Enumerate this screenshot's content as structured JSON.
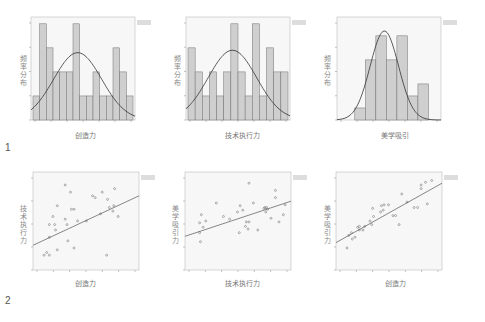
{
  "panel_labels": [
    "1",
    "2"
  ],
  "chart_data": [
    {
      "type": "bar",
      "title": "",
      "subtype": "histogram_with_normal_curve",
      "xlabel": "创造力",
      "ylabel": "频率分布",
      "categories": [
        "b1",
        "b2",
        "b3",
        "b4",
        "b5",
        "b6",
        "b7",
        "b8",
        "b9",
        "b10",
        "b11",
        "b12",
        "b13",
        "b14",
        "b15"
      ],
      "values": [
        1,
        4,
        3,
        2,
        2,
        2,
        4,
        1,
        1,
        2,
        1,
        1,
        3,
        2,
        1
      ],
      "ylim": [
        0,
        4.2
      ],
      "normal_curve": {
        "peak_bin": 7.5,
        "peak": 2.8,
        "sd_bins": 3.6
      },
      "legend": "Mean / Std. Dev. / N",
      "grid": false
    },
    {
      "type": "bar",
      "title": "",
      "subtype": "histogram_with_normal_curve",
      "xlabel": "技术执行力",
      "ylabel": "频率分布",
      "categories": [
        "b1",
        "b2",
        "b3",
        "b4",
        "b5",
        "b6",
        "b7",
        "b8",
        "b9",
        "b10",
        "b11",
        "b12",
        "b13",
        "b14"
      ],
      "values": [
        3,
        2,
        1,
        2,
        1,
        2,
        4,
        2,
        1,
        4,
        1,
        3,
        2,
        2
      ],
      "ylim": [
        0,
        4.2
      ],
      "normal_curve": {
        "peak_bin": 7.0,
        "peak": 2.9,
        "sd_bins": 3.4
      },
      "legend": "Mean / Std. Dev. / N",
      "grid": false
    },
    {
      "type": "bar",
      "title": "",
      "subtype": "histogram_with_normal_curve",
      "xlabel": "美学吸引",
      "ylabel": "频率分布",
      "categories": [
        "b1",
        "b2",
        "b3",
        "b4",
        "b5",
        "b6",
        "b7"
      ],
      "values": [
        1,
        5,
        7,
        5,
        7,
        2,
        3
      ],
      "ylim": [
        0,
        8.4
      ],
      "normal_curve": {
        "peak_bin": 3.5,
        "peak": 7.4,
        "sd_bins": 1.35
      },
      "bar_offset_bins": 1.5,
      "total_bins": 9.5,
      "legend": "Mean / Std. Dev. / N",
      "grid": false
    },
    {
      "type": "scatter",
      "title": "",
      "xlabel": "创造力",
      "ylabel": "技术执行力",
      "legend": "R² Linear = 0.176",
      "xlim": [
        0,
        100
      ],
      "ylim": [
        0,
        100
      ],
      "points": [
        [
          8,
          12
        ],
        [
          11,
          15
        ],
        [
          14,
          12
        ],
        [
          14,
          32
        ],
        [
          14,
          46
        ],
        [
          18,
          55
        ],
        [
          20,
          46
        ],
        [
          21,
          40
        ],
        [
          23,
          18
        ],
        [
          23,
          67
        ],
        [
          32,
          90
        ],
        [
          32,
          52
        ],
        [
          34,
          46
        ],
        [
          35,
          28
        ],
        [
          38,
          82
        ],
        [
          39,
          63
        ],
        [
          42,
          63
        ],
        [
          42,
          20
        ],
        [
          46,
          50
        ],
        [
          56,
          50
        ],
        [
          63,
          78
        ],
        [
          66,
          76
        ],
        [
          72,
          58
        ],
        [
          74,
          82
        ],
        [
          79,
          12
        ],
        [
          80,
          74
        ],
        [
          82,
          65
        ],
        [
          86,
          61
        ],
        [
          88,
          86
        ],
        [
          87,
          67
        ],
        [
          92,
          55
        ]
      ],
      "trend": {
        "x": [
          0,
          100
        ],
        "y": [
          23,
          78
        ]
      }
    },
    {
      "type": "scatter",
      "title": "",
      "xlabel": "技术执行力",
      "ylabel": "美学吸引力",
      "legend": "R² Linear",
      "xlim": [
        0,
        100
      ],
      "ylim": [
        0,
        100
      ],
      "points": [
        [
          12,
          48
        ],
        [
          12,
          37
        ],
        [
          13,
          27
        ],
        [
          14,
          57
        ],
        [
          16,
          43
        ],
        [
          19,
          50
        ],
        [
          31,
          70
        ],
        [
          39,
          55
        ],
        [
          46,
          52
        ],
        [
          55,
          60
        ],
        [
          57,
          37
        ],
        [
          58,
          67
        ],
        [
          61,
          62
        ],
        [
          64,
          44
        ],
        [
          65,
          49
        ],
        [
          67,
          41
        ],
        [
          68,
          49
        ],
        [
          68,
          92
        ],
        [
          73,
          70
        ],
        [
          78,
          40
        ],
        [
          85,
          64
        ],
        [
          86,
          65
        ],
        [
          87,
          60
        ],
        [
          88,
          65
        ],
        [
          89,
          63
        ],
        [
          93,
          53
        ],
        [
          98,
          76
        ],
        [
          98,
          84
        ],
        [
          102,
          49
        ],
        [
          109,
          68
        ],
        [
          107,
          57
        ]
      ],
      "trend": {
        "x": [
          0,
          100
        ],
        "y": [
          33,
          72
        ]
      }
    },
    {
      "type": "scatter",
      "title": "",
      "xlabel": "创造力",
      "ylabel": "美学吸引力",
      "legend": "R² Linear = 0.778",
      "xlim": [
        0,
        100
      ],
      "ylim": [
        0,
        100
      ],
      "points": [
        [
          8,
          20
        ],
        [
          10,
          34
        ],
        [
          13,
          37
        ],
        [
          14,
          30
        ],
        [
          17,
          32
        ],
        [
          20,
          43
        ],
        [
          22,
          40
        ],
        [
          22,
          44
        ],
        [
          26,
          40
        ],
        [
          28,
          44
        ],
        [
          34,
          50
        ],
        [
          36,
          46
        ],
        [
          37,
          64
        ],
        [
          38,
          55
        ],
        [
          46,
          60
        ],
        [
          47,
          67
        ],
        [
          49,
          62
        ],
        [
          50,
          68
        ],
        [
          55,
          68
        ],
        [
          60,
          56
        ],
        [
          63,
          56
        ],
        [
          67,
          46
        ],
        [
          70,
          80
        ],
        [
          76,
          71
        ],
        [
          84,
          65
        ],
        [
          88,
          65
        ],
        [
          92,
          86
        ],
        [
          92,
          90
        ],
        [
          97,
          93
        ],
        [
          99,
          69
        ],
        [
          104,
          95
        ]
      ],
      "trend": {
        "x": [
          0,
          100
        ],
        "y": [
          26,
          92
        ]
      }
    }
  ]
}
